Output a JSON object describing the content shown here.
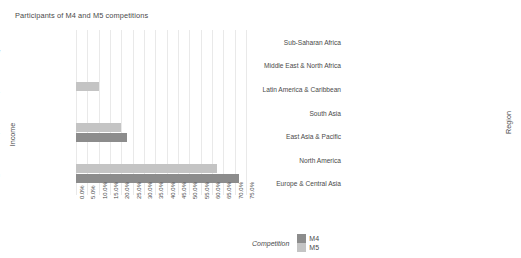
{
  "title": "Participants of M4 and M5 competitions",
  "legend": {
    "title": "Competition",
    "items": [
      {
        "label": "M4",
        "color": "#8c8c8c"
      },
      {
        "label": "M5",
        "color": "#c4c4c4"
      }
    ]
  },
  "colors": {
    "m4": "#8c8c8c",
    "m5": "#c4c4c4",
    "grid": "#e9e9e9",
    "text": "#4a4a4a",
    "background": "#ffffff"
  },
  "chart_data": [
    {
      "type": "bar",
      "orientation": "horizontal",
      "title": "Participants of M4 and M5 competitions",
      "ylabel": "Income",
      "xlabel": "",
      "grid": true,
      "legend_position": "bottom",
      "xlim": [
        0,
        75
      ],
      "xticks": [
        "0.0%",
        "5.0%",
        "10.0%",
        "15.0%",
        "20.0%",
        "25.0%",
        "30.0%",
        "35.0%",
        "40.0%",
        "45.0%",
        "50.0%",
        "55.0%",
        "60.0%",
        "65.0%",
        "70.0%",
        "75.0%"
      ],
      "xtick_values": [
        0,
        5,
        10,
        15,
        20,
        25,
        30,
        35,
        40,
        45,
        50,
        55,
        60,
        65,
        70,
        75
      ],
      "categories": [
        "Low",
        "Lower middle",
        "Upper middle",
        "High"
      ],
      "series": [
        {
          "name": "M5",
          "color": "#c4c4c4",
          "values": [
            0,
            10.0,
            20.0,
            62.0
          ]
        },
        {
          "name": "M4",
          "color": "#8c8c8c",
          "values": [
            0,
            0,
            22.5,
            72.0
          ]
        }
      ]
    },
    {
      "type": "bar",
      "orientation": "horizontal",
      "title": "",
      "ylabel": "Region",
      "xlabel": "",
      "grid": true,
      "legend_position": "bottom",
      "xlim": [
        0,
        55
      ],
      "xticks": [
        "0.0%",
        "5.0%",
        "10.0%",
        "15.0%",
        "20.0%",
        "25.0%",
        "30.0%",
        "35.0%",
        "40.0%",
        "45.0%",
        "50.0%",
        "55.0%"
      ],
      "xtick_values": [
        0,
        5,
        10,
        15,
        20,
        25,
        30,
        35,
        40,
        45,
        50,
        55
      ],
      "categories": [
        "Sub-Saharan Africa",
        "Middle East & North Africa",
        "Latin America & Caribbean",
        "South Asia",
        "East Asia & Pacific",
        "North America",
        "Europe & Central Asia"
      ],
      "series": [
        {
          "name": "M5",
          "color": "#c4c4c4",
          "values": [
            0.4,
            1.0,
            1.2,
            10.5,
            37.0,
            15.5,
            20.5
          ]
        },
        {
          "name": "M4",
          "color": "#8c8c8c",
          "values": [
            0,
            0,
            7.5,
            0,
            4.0,
            29.0,
            52.0
          ]
        }
      ]
    }
  ]
}
